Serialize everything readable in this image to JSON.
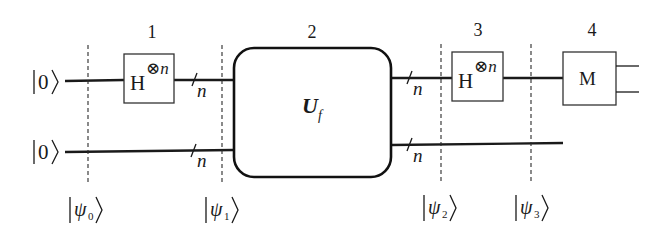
{
  "diagram": {
    "type": "quantum-circuit",
    "title": "",
    "steps": [
      {
        "label": "1",
        "x": 152
      },
      {
        "label": "2",
        "x": 312
      },
      {
        "label": "3",
        "x": 478
      },
      {
        "label": "4",
        "x": 592
      }
    ],
    "inputs": [
      {
        "ket": "|0⟩",
        "ket_inner": "0"
      },
      {
        "ket": "|0⟩",
        "ket_inner": "0"
      }
    ],
    "register_size_label": "n",
    "gates": {
      "hadamard_1": {
        "base": "H",
        "superscript": "⊗n"
      },
      "oracle": {
        "base": "U",
        "subscript": "f"
      },
      "hadamard_2": {
        "base": "H",
        "superscript": "⊗n"
      },
      "measure": {
        "label": "M"
      }
    },
    "states": [
      {
        "name": "ψ",
        "index": "0",
        "x": 88
      },
      {
        "name": "ψ",
        "index": "1",
        "x": 222
      },
      {
        "name": "ψ",
        "index": "2",
        "x": 441
      },
      {
        "name": "ψ",
        "index": "3",
        "x": 531
      }
    ],
    "colors": {
      "line": "#1a1a1a",
      "background": "#ffffff"
    }
  }
}
